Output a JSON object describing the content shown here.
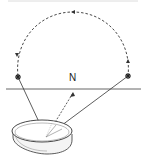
{
  "diagram": {
    "labels": {
      "north": "N"
    },
    "elements": {
      "horizon": "horizon-line",
      "arc": "star-path-arc",
      "star_left": "star-rising",
      "star_right": "star-setting",
      "compass": "compass-dish",
      "north_arrow": "north-direction"
    },
    "colors": {
      "stroke": "#333333",
      "top_rule": "#d0d0d0"
    }
  }
}
